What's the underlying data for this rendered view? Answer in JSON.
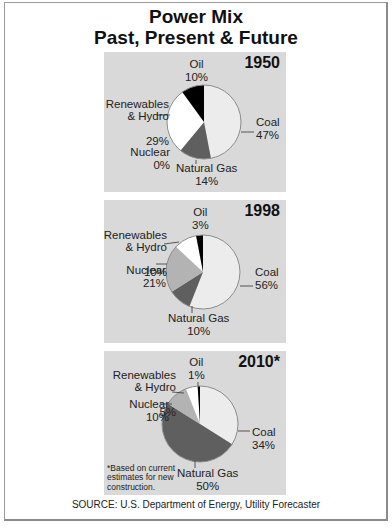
{
  "title_line1": "Power Mix",
  "title_line2": "Past, Present & Future",
  "source": "SOURCE: U.S. Department of Energy, Utility Forecaster",
  "colors": {
    "coal": "#ececec",
    "natural_gas": "#5f5f5f",
    "nuclear": "#b3b3b3",
    "renewables": "#ffffff",
    "oil": "#000000",
    "panel_bg": "#d9d9d9",
    "outline": "#8c8c8c"
  },
  "chart_data": [
    {
      "type": "pie",
      "title": "1950",
      "categories": [
        "Coal",
        "Natural Gas",
        "Nuclear",
        "Renewables & Hydro",
        "Oil"
      ],
      "values": [
        47,
        14,
        0,
        29,
        10
      ],
      "labels": [
        {
          "name": "Coal",
          "pct": "47%"
        },
        {
          "name": "Natural Gas",
          "pct": "14%"
        },
        {
          "name": "Nuclear",
          "pct": "0%"
        },
        {
          "name": "Renewables\n& Hydro",
          "pct": "29%"
        },
        {
          "name": "Oil",
          "pct": "10%"
        }
      ]
    },
    {
      "type": "pie",
      "title": "1998",
      "categories": [
        "Coal",
        "Natural Gas",
        "Nuclear",
        "Renewables & Hydro",
        "Oil"
      ],
      "values": [
        56,
        10,
        21,
        10,
        3
      ],
      "labels": [
        {
          "name": "Coal",
          "pct": "56%"
        },
        {
          "name": "Natural Gas",
          "pct": "10%"
        },
        {
          "name": "Nuclear",
          "pct": "21%"
        },
        {
          "name": "Renewables\n& Hydro",
          "pct": "10%"
        },
        {
          "name": "Oil",
          "pct": "3%"
        }
      ]
    },
    {
      "type": "pie",
      "title": "2010*",
      "categories": [
        "Coal",
        "Natural Gas",
        "Nuclear",
        "Renewables & Hydro",
        "Oil"
      ],
      "values": [
        34,
        50,
        10,
        5,
        1
      ],
      "labels": [
        {
          "name": "Coal",
          "pct": "34%"
        },
        {
          "name": "Natural Gas",
          "pct": "50%"
        },
        {
          "name": "Nuclear",
          "pct": "10%"
        },
        {
          "name": "Renewables\n& Hydro",
          "pct": "5%"
        },
        {
          "name": "Oil",
          "pct": "1%"
        }
      ],
      "footnote": "*Based on current\nestimates for new\nconstruction."
    }
  ]
}
